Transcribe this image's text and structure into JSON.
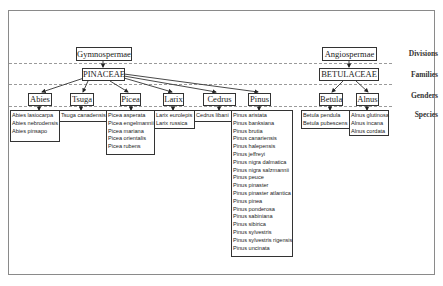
{
  "row_labels": {
    "divisions": "Divisions",
    "families": "Families",
    "genders": "Genders",
    "species": "Species"
  },
  "divisions": {
    "gymnospermae": "Gymnospermae",
    "angiospermae": "Angiospermae"
  },
  "families": {
    "pinaceae": "PINACEAE",
    "betulaceae": "BETULACEAE"
  },
  "genera": {
    "abies": "Abies",
    "tsuga": "Tsuga",
    "picea": "Picea",
    "larix": "Larix",
    "cedrus": "Cedrus",
    "pinus": "Pinus",
    "betula": "Betula",
    "alnus": "Alnus"
  },
  "species": {
    "abies": [
      "Abies lasiocarpa",
      "Abies nebrodensis",
      "Abies pinsapo"
    ],
    "tsuga": [
      "Tsuga canadensis"
    ],
    "picea": [
      "Picea asperata",
      "Picea engelmannii",
      "Picea mariana",
      "Picea orientalis",
      "Picea rubens"
    ],
    "larix": [
      "Larix eurolepis",
      "Larix russica"
    ],
    "cedrus": [
      "Cedrus libani"
    ],
    "pinus": [
      "Pinus aristata",
      "Pinus banksiana",
      "Pinus brutia",
      "Pinus canariensis",
      "Pinus halepensis",
      "Pinus jeffreyi",
      "Pinus nigra dalmatica",
      "Pinus nigra salzmannii",
      "Pinus peuce",
      "Pinus pinaster",
      "Pinus pinaster atlantica",
      "Pinus pinea",
      "Pinus ponderosa",
      "Pinus sabiniana",
      "Pinus sibirica",
      "Pinus sylvestris",
      "Pinus sylvestris rigensis",
      "Pinus uncinata"
    ],
    "betula": [
      "Betula pendula",
      "Betula pubescens"
    ],
    "alnus": [
      "Alnus glutinosa",
      "Alnus incana",
      "Alnus cordata"
    ]
  }
}
